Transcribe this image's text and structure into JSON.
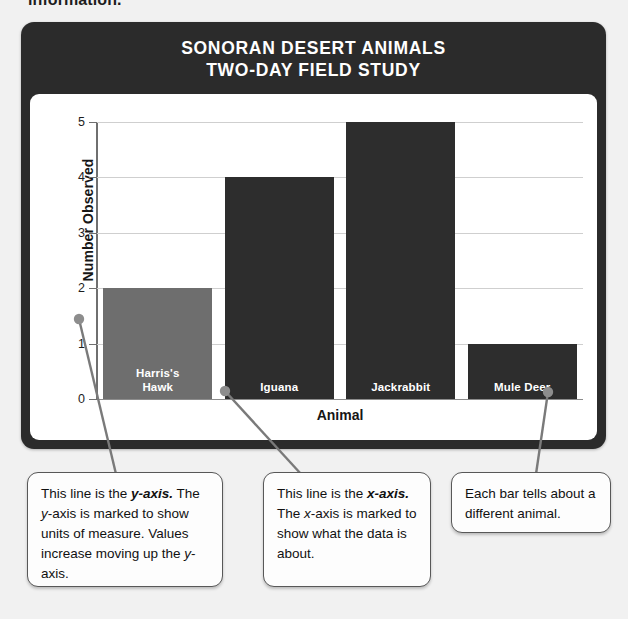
{
  "page": {
    "top_fragment": "information."
  },
  "chart_card": {
    "title_line1": "SONORAN DESERT ANIMALS",
    "title_line2": "TWO-DAY FIELD STUDY",
    "header_color": "#2b2b2b",
    "panel_color": "#ffffff"
  },
  "chart_data": {
    "type": "bar",
    "title": "SONORAN DESERT ANIMALS TWO-DAY FIELD STUDY",
    "categories": [
      "Harris's Hawk",
      "Iguana",
      "Jackrabbit",
      "Mule Deer"
    ],
    "category_lines": [
      [
        "Harris's",
        "Hawk"
      ],
      [
        "Iguana"
      ],
      [
        "Jackrabbit"
      ],
      [
        "Mule Deer"
      ]
    ],
    "values": [
      2,
      4,
      5,
      1
    ],
    "bar_colors": [
      "#6e6e6e",
      "#2d2d2d",
      "#2d2d2d",
      "#2d2d2d"
    ],
    "xlabel": "Animal",
    "ylabel": "Number Observed",
    "ylim": [
      0,
      5
    ],
    "yticks": [
      "0",
      "1",
      "2",
      "3",
      "4",
      "5"
    ],
    "grid": true,
    "legend": "none"
  },
  "callouts": {
    "y_axis": {
      "part1": "This line is the ",
      "term": "y-axis.",
      "part2": " The ",
      "term2": "y",
      "part3": "-axis is marked to show units of measure. Values increase moving up the ",
      "term3": "y",
      "part4": "-axis."
    },
    "x_axis": {
      "part1": "This line is the ",
      "term": "x-axis.",
      "part2": " The ",
      "term2": "x",
      "part3": "-axis is marked to show what the data is about."
    },
    "bars": {
      "text": "Each bar tells about a different animal."
    }
  }
}
